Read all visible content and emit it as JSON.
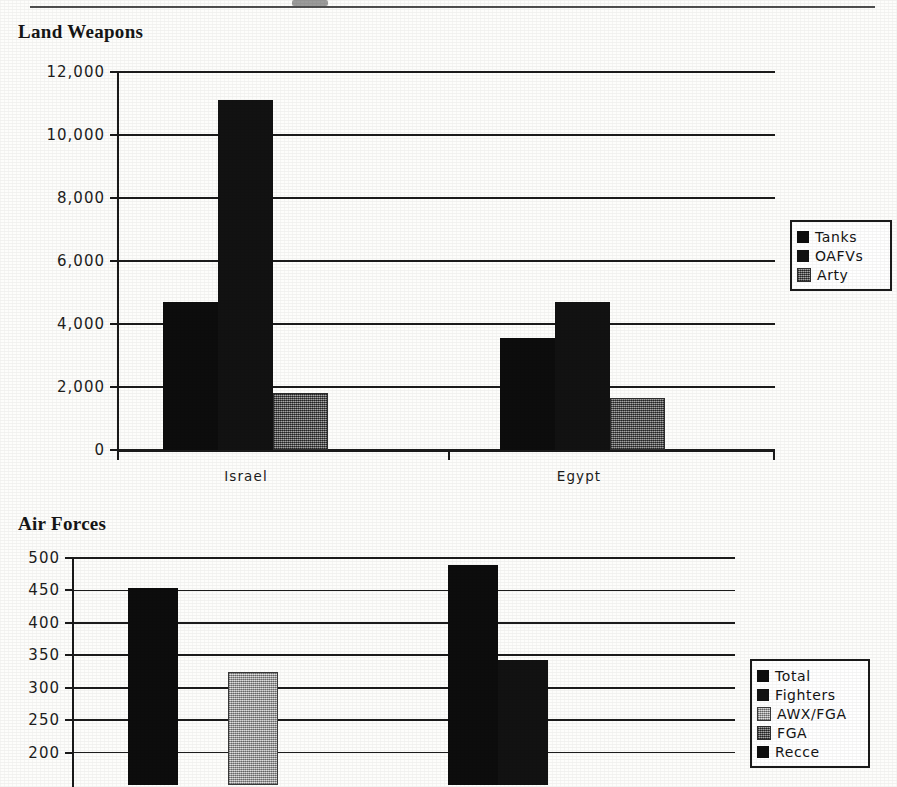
{
  "page": {
    "header_rule": "horizontal-rule",
    "background_note": "scanned book page"
  },
  "charts": [
    {
      "id": "land-weapons",
      "title": "Land Weapons"
    },
    {
      "id": "air-forces",
      "title": "Air Forces"
    }
  ],
  "chart_data": [
    {
      "type": "bar",
      "title": "Land Weapons",
      "xlabel": "",
      "ylabel": "",
      "categories": [
        "Israel",
        "Egypt"
      ],
      "series": [
        {
          "name": "Tanks",
          "values": [
            4700,
            3550
          ],
          "color": "#0d0d0d"
        },
        {
          "name": "OAFVs",
          "values": [
            11100,
            4700
          ],
          "color": "#121212"
        },
        {
          "name": "Arty",
          "values": [
            1800,
            1650
          ],
          "color": "#6e6e6e"
        }
      ],
      "ylim": [
        0,
        12000
      ],
      "yticks": [
        0,
        2000,
        4000,
        6000,
        8000,
        10000,
        12000
      ],
      "ytick_labels": [
        "0",
        "2,000",
        "4,000",
        "6,000",
        "8,000",
        "10,000",
        "12,000"
      ],
      "grid": true,
      "legend_position": "right"
    },
    {
      "type": "bar",
      "title": "Air Forces",
      "xlabel": "",
      "ylabel": "",
      "categories": [
        "Israel",
        "Egypt"
      ],
      "series": [
        {
          "name": "Total",
          "values": [
            453,
            490
          ],
          "color": "#0d0d0d"
        },
        {
          "name": "Fighters",
          "values": [
            0,
            343
          ],
          "color": "#121212"
        },
        {
          "name": "AWX/FGA",
          "values": [
            325,
            0
          ],
          "color": "#bdbdbd"
        },
        {
          "name": "FGA",
          "values": [
            0,
            0
          ],
          "color": "#6e6e6e"
        },
        {
          "name": "Recce",
          "values": [
            0,
            0
          ],
          "color": "#0d0d0d"
        }
      ],
      "ylim": [
        150,
        500
      ],
      "yticks": [
        200,
        250,
        300,
        350,
        400,
        450,
        500
      ],
      "ytick_labels": [
        "200",
        "250",
        "300",
        "350",
        "400",
        "450",
        "500"
      ],
      "grid": true,
      "legend_position": "right",
      "note": "chart is cropped at the bottom edge of the page"
    }
  ],
  "land_chart": {
    "ytick_labels": [
      "12,000",
      "10,000",
      "8,000",
      "6,000",
      "4,000",
      "2,000",
      "0"
    ],
    "xtick_labels": [
      "Israel",
      "Egypt"
    ],
    "legend": [
      {
        "label": "Tanks",
        "swatch": "black"
      },
      {
        "label": "OAFVs",
        "swatch": "dark"
      },
      {
        "label": "Arty",
        "swatch": "mid"
      }
    ]
  },
  "air_chart": {
    "ytick_labels": [
      "500",
      "450",
      "400",
      "350",
      "300",
      "250",
      "200"
    ],
    "legend": [
      {
        "label": "Total",
        "swatch": "black"
      },
      {
        "label": "Fighters",
        "swatch": "dark"
      },
      {
        "label": "AWX/FGA",
        "swatch": "light"
      },
      {
        "label": "FGA",
        "swatch": "mid"
      },
      {
        "label": "Recce",
        "swatch": "black"
      }
    ]
  }
}
